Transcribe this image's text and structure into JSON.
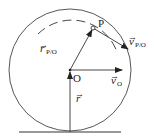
{
  "diagram": {
    "labels": {
      "point_p": "P",
      "point_o": "O",
      "r_po": "r",
      "r_po_sub": "P/O",
      "v_po": "v",
      "v_po_sub": "P/O",
      "v_o": "v",
      "v_o_sub": "O",
      "r": "r",
      "vector_arrow": "→"
    },
    "colors": {
      "stroke": "#333333",
      "background": "#ffffff"
    }
  }
}
